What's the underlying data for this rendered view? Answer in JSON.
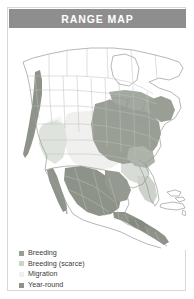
{
  "panel": {
    "title": "RANGE MAP",
    "border_color": "#d8d8d8",
    "title_bar_color": "#8e8e8e",
    "title_text_color": "#ffffff",
    "background_color": "#ffffff"
  },
  "legend": {
    "items": [
      {
        "label": "Breeding",
        "swatch_color": "#9a9f96",
        "icon": "color-swatch-icon"
      },
      {
        "label": "Breeding (scarce)",
        "swatch_color": "#cdd2cb",
        "icon": "color-swatch-icon"
      },
      {
        "label": "Migration",
        "swatch_color": "#f0f1ef",
        "icon": "color-swatch-icon"
      },
      {
        "label": "Year-round",
        "swatch_color": "#8e9389",
        "icon": "color-swatch-icon"
      }
    ]
  },
  "map": {
    "region_name": "North America",
    "land_outline_color": "#9a9a9a",
    "border_line_color": "#b4b4b4",
    "colors": {
      "breeding": "#9a9f96",
      "breeding_scarce": "#cdd2cb",
      "migration": "#f0f1ef",
      "year_round": "#8e9389",
      "unshaded_land": "#ffffff"
    },
    "shaded_regions": [
      {
        "name": "eastern-united-states-breeding",
        "category": "breeding"
      },
      {
        "name": "great-lakes-breeding",
        "category": "breeding"
      },
      {
        "name": "northeast-breeding",
        "category": "breeding"
      },
      {
        "name": "central-plains-migration",
        "category": "migration"
      },
      {
        "name": "southwest-breeding-scarce",
        "category": "breeding_scarce"
      },
      {
        "name": "pacific-coast-year-round",
        "category": "year_round"
      },
      {
        "name": "mexico-highlands-year-round",
        "category": "year_round"
      },
      {
        "name": "mexico-gulf-coast-year-round",
        "category": "year_round"
      },
      {
        "name": "central-america-year-round",
        "category": "year_round"
      },
      {
        "name": "florida-breeding-scarce",
        "category": "breeding_scarce"
      },
      {
        "name": "caribbean-islands-unshaded",
        "category": "unshaded_land"
      },
      {
        "name": "canada-unshaded",
        "category": "unshaded_land"
      }
    ]
  }
}
